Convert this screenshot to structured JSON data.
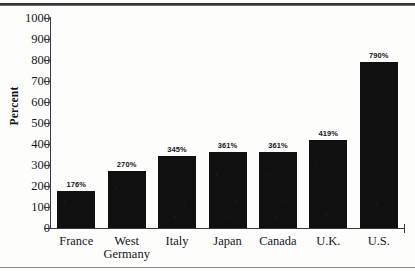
{
  "chart_data": {
    "type": "bar",
    "title": "",
    "xlabel": "",
    "ylabel": "Percent",
    "ylim": [
      0,
      1000
    ],
    "ytick_step": 100,
    "grid": false,
    "legend": null,
    "bar_color": "#101010",
    "background": "#fdfdfc",
    "categories": [
      "France",
      "West\nGermany",
      "Italy",
      "Japan",
      "Canada",
      "U.K.",
      "U.S."
    ],
    "values": [
      176,
      270,
      345,
      361,
      361,
      419,
      790
    ],
    "data_labels": [
      "176%",
      "270%",
      "345%",
      "361%",
      "361%",
      "419%",
      "790%"
    ],
    "ytick_labels": [
      "1000",
      "900",
      "800",
      "700",
      "600",
      "500",
      "400",
      "300",
      "200",
      "100",
      "0"
    ],
    "ytick_values": [
      1000,
      900,
      800,
      700,
      600,
      500,
      400,
      300,
      200,
      100,
      0
    ]
  }
}
